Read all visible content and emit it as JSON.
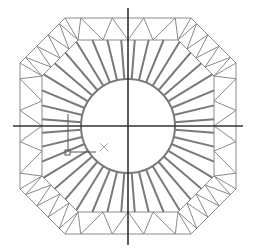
{
  "drawing": {
    "title": "Octagonal truss ring with circular core",
    "center": [
      128,
      126
    ],
    "circle_radius": 47,
    "outer_octagon_half": 108,
    "inner_octagon_half": 86,
    "outer_chamfer_offset": 45,
    "inner_chamfer_offset": 36,
    "spokes_per_octant": 5,
    "zigzag_segments_per_edge": 4,
    "axis": {
      "horizontal": {
        "x1": 13,
        "x2": 243,
        "y": 126
      },
      "vertical": {
        "x": 128,
        "y1": 8,
        "y2": 245
      }
    },
    "colors": {
      "truss": "#8a8a8a",
      "spoke": "#7a7a7a",
      "circle": "#7a7a7a",
      "axis": "#333333",
      "cursor": "#555555",
      "cursor_x": "#aaaaaa"
    },
    "cursor": {
      "box": [
        66,
        152
      ],
      "vertical_from": 114,
      "marker_x": [
        104,
        147
      ]
    }
  }
}
